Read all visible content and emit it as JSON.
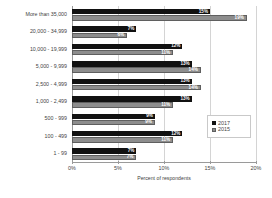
{
  "chart_data": {
    "type": "bar",
    "orientation": "horizontal",
    "title": "",
    "xlabel": "Percent of respondents",
    "ylabel": "",
    "xlim": [
      0,
      20
    ],
    "xticks": [
      "0%",
      "5%",
      "10%",
      "15%",
      "20%"
    ],
    "xtick_values": [
      0,
      5,
      10,
      15,
      20
    ],
    "grid": true,
    "legend_position": "right",
    "categories": [
      "More than 35,000",
      "20,000 - 34,999",
      "10,000 - 19,999",
      "5,000 - 9,999",
      "2,500 - 4,999",
      "1,000 - 2,499",
      "500 - 999",
      "100 - 499",
      "1 - 99"
    ],
    "series": [
      {
        "name": "2017",
        "color": "#111111",
        "values": [
          15,
          7,
          12,
          13,
          13,
          13,
          9,
          12,
          7
        ],
        "labels": [
          "15%",
          "7%",
          "12%",
          "13%",
          "13%",
          "13%",
          "9%",
          "12%",
          "7%"
        ]
      },
      {
        "name": "2015",
        "color": "#8d8d8d",
        "values": [
          19,
          6,
          11,
          14,
          14,
          11,
          9,
          11,
          7
        ],
        "labels": [
          "19%",
          "6%",
          "11%",
          "14%",
          "14%",
          "11%",
          "9%",
          "11%",
          "7%"
        ]
      }
    ]
  },
  "legend": {
    "items": [
      {
        "label": "2017"
      },
      {
        "label": "2015"
      }
    ]
  }
}
